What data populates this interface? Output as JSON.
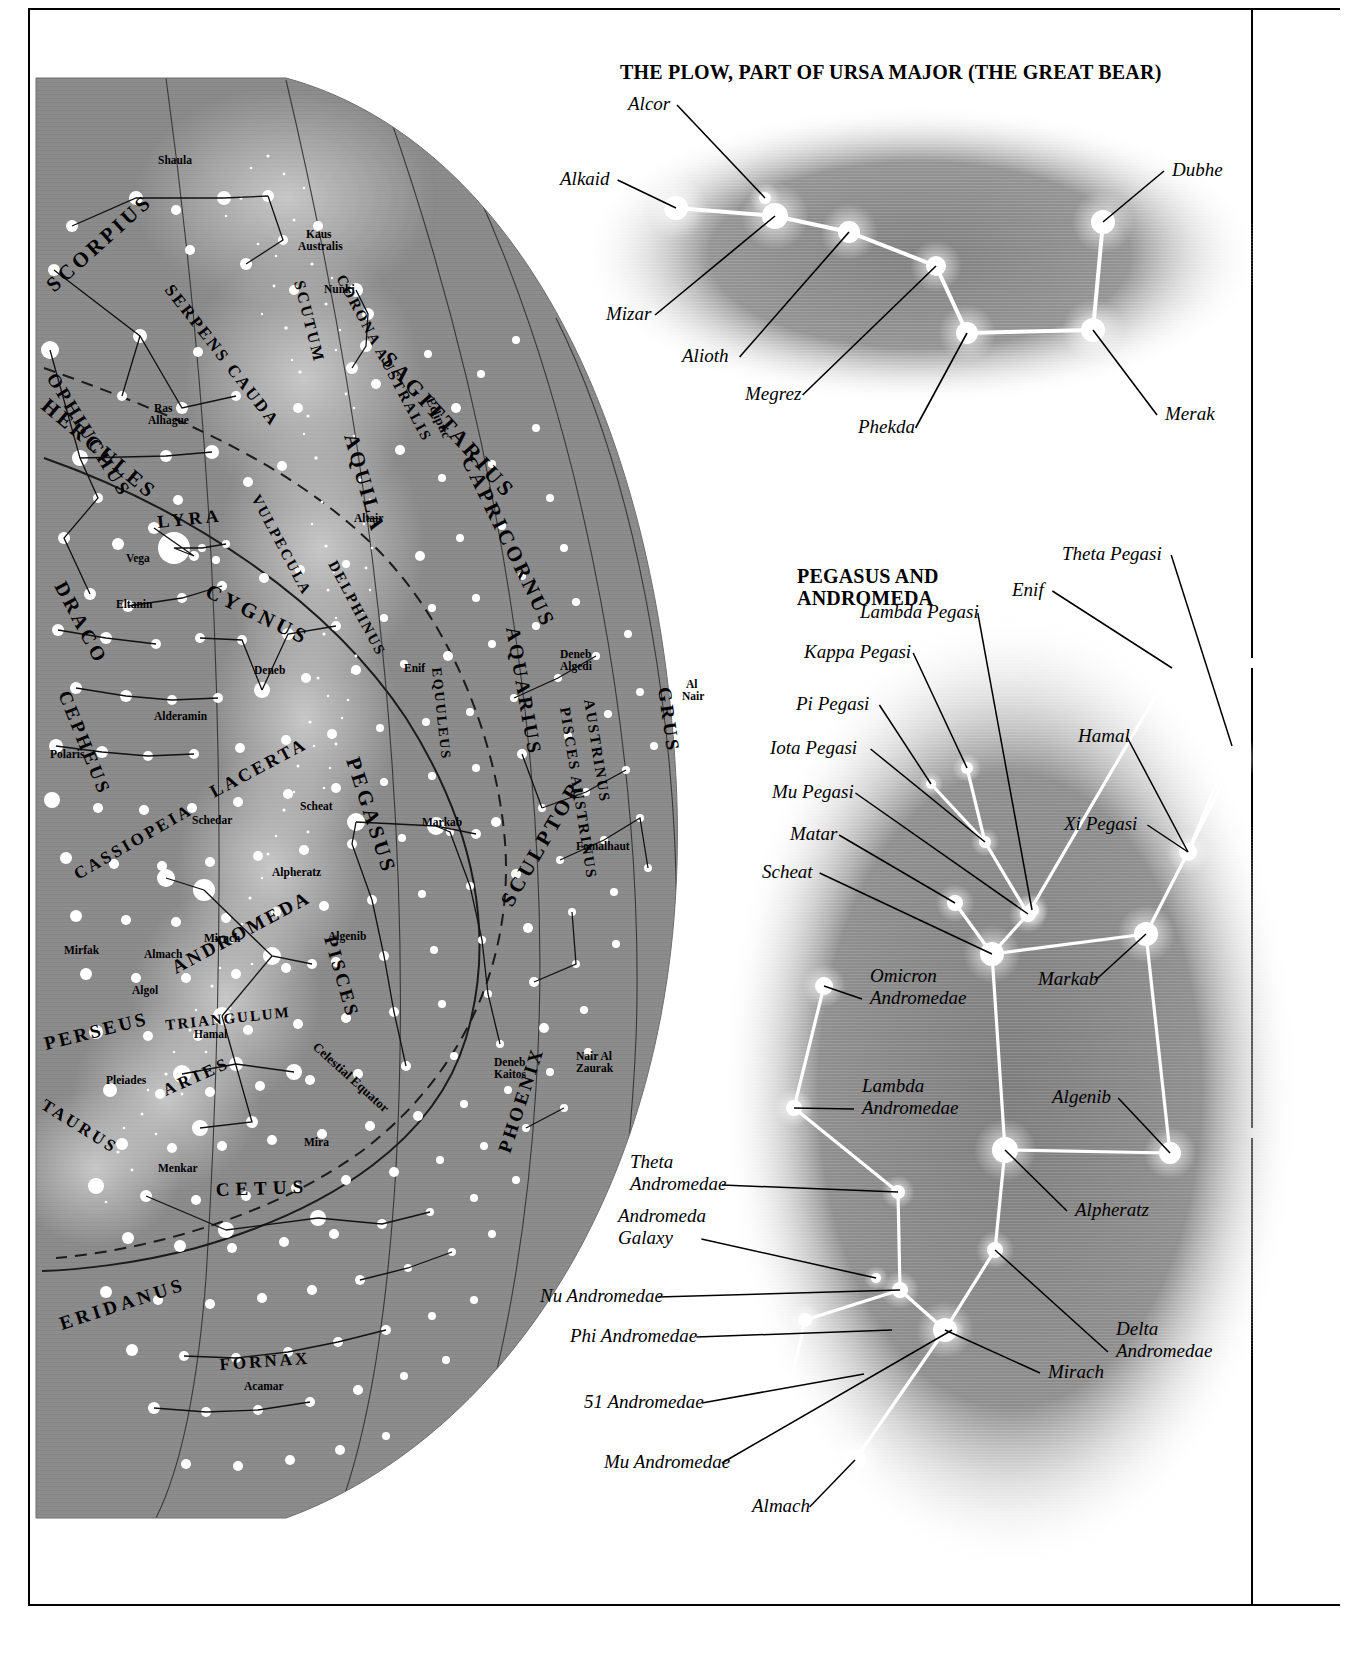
{
  "page": {
    "background_color": "#ffffff",
    "sky_fill": "#8c8c8c",
    "star_color": "#ffffff",
    "line_color": "#000000"
  },
  "plow_panel": {
    "title": "THE PLOW, PART OF URSA MAJOR (THE GREAT BEAR)",
    "labels": [
      {
        "name": "Alcor",
        "text": "Alcor",
        "lx": 68,
        "ly": 30,
        "tx": 205,
        "ty": 118
      },
      {
        "name": "Alkaid",
        "text": "Alkaid",
        "lx": 0,
        "ly": 105,
        "tx": 116,
        "ty": 128
      },
      {
        "name": "Mizar",
        "text": "Mizar",
        "lx": 46,
        "ly": 240,
        "tx": 215,
        "ty": 136
      },
      {
        "name": "Alioth",
        "text": "Alioth",
        "lx": 122,
        "ly": 282,
        "tx": 289,
        "ty": 152
      },
      {
        "name": "Megrez",
        "text": "Megrez",
        "lx": 185,
        "ly": 320,
        "tx": 376,
        "ty": 186
      },
      {
        "name": "Phekda",
        "text": "Phekda",
        "lx": 298,
        "ly": 353,
        "tx": 407,
        "ty": 253
      },
      {
        "name": "Dubhe",
        "text": "Dubhe",
        "lx": 612,
        "ly": 96,
        "tx": 543,
        "ty": 142
      },
      {
        "name": "Merak",
        "text": "Merak",
        "lx": 605,
        "ly": 340,
        "tx": 533,
        "ty": 250
      }
    ],
    "stars": [
      {
        "name": "alkaid",
        "x": 116,
        "y": 128,
        "r": 12
      },
      {
        "name": "alcor",
        "x": 205,
        "y": 118,
        "r": 6
      },
      {
        "name": "mizar",
        "x": 215,
        "y": 136,
        "r": 13
      },
      {
        "name": "alioth",
        "x": 289,
        "y": 152,
        "r": 11
      },
      {
        "name": "megrez",
        "x": 376,
        "y": 186,
        "r": 10
      },
      {
        "name": "phekda",
        "x": 407,
        "y": 253,
        "r": 11
      },
      {
        "name": "merak",
        "x": 533,
        "y": 250,
        "r": 12
      },
      {
        "name": "dubhe",
        "x": 543,
        "y": 142,
        "r": 12
      }
    ],
    "asterism": [
      [
        "alkaid",
        "mizar"
      ],
      [
        "mizar",
        "alioth"
      ],
      [
        "alioth",
        "megrez"
      ],
      [
        "megrez",
        "phekda"
      ],
      [
        "phekda",
        "merak"
      ],
      [
        "merak",
        "dubhe"
      ]
    ]
  },
  "pegasus_panel": {
    "title_line1": "PEGASUS AND",
    "title_line2": "ANDROMEDA",
    "labels": [
      {
        "name": "theta-pegasi",
        "text": "Theta Pegasi",
        "lx": 522,
        "ly": 30,
        "tx": 692,
        "ty": 216
      },
      {
        "name": "enif",
        "text": "Enif",
        "lx": 472,
        "ly": 66,
        "tx": 632,
        "ty": 138
      },
      {
        "name": "lambda-pegasi",
        "text": "Lambda Pegasi",
        "lx": 320,
        "ly": 88,
        "tx": 492,
        "ty": 380
      },
      {
        "name": "kappa-pegasi",
        "text": "Kappa Pegasi",
        "lx": 264,
        "ly": 128,
        "tx": 427,
        "ty": 238
      },
      {
        "name": "pi-pegasi",
        "text": "Pi Pegasi",
        "lx": 256,
        "ly": 180,
        "tx": 391,
        "ty": 254
      },
      {
        "name": "iota-pegasi",
        "text": "Iota Pegasi",
        "lx": 230,
        "ly": 224,
        "tx": 445,
        "ty": 312
      },
      {
        "name": "mu-pegasi",
        "text": "Mu Pegasi",
        "lx": 232,
        "ly": 268,
        "tx": 488,
        "ty": 384
      },
      {
        "name": "matar",
        "text": "Matar",
        "lx": 250,
        "ly": 310,
        "tx": 415,
        "ty": 373
      },
      {
        "name": "scheat",
        "text": "Scheat",
        "lx": 222,
        "ly": 348,
        "tx": 452,
        "ty": 424
      },
      {
        "name": "hamal",
        "text": "Hamal",
        "lx": 538,
        "ly": 212,
        "tx": 648,
        "ty": 322
      },
      {
        "name": "xi-pegasi",
        "text": "Xi Pegasi",
        "lx": 524,
        "ly": 300,
        "tx": 648,
        "ty": 322
      },
      {
        "name": "markab",
        "text": "Markab",
        "lx": 498,
        "ly": 455,
        "tx": 606,
        "ty": 404
      },
      {
        "name": "omicron-andromedae",
        "text": "Omicron\nAndromedae",
        "lx": 330,
        "ly": 452,
        "tx": 284,
        "ty": 456
      },
      {
        "name": "lambda-andromedae",
        "text": "Lambda\nAndromedae",
        "lx": 322,
        "ly": 562,
        "tx": 254,
        "ty": 578
      },
      {
        "name": "algenib",
        "text": "Algenib",
        "lx": 512,
        "ly": 573,
        "tx": 630,
        "ty": 623
      },
      {
        "name": "alpheratz",
        "text": "Alpheratz",
        "lx": 535,
        "ly": 686,
        "tx": 465,
        "ty": 620
      },
      {
        "name": "theta-andromedae",
        "text": "Theta\nAndromedae",
        "lx": 90,
        "ly": 638,
        "tx": 358,
        "ty": 662
      },
      {
        "name": "andromeda-galaxy",
        "text": "Andromeda\nGalaxy",
        "lx": 78,
        "ly": 692,
        "tx": 336,
        "ty": 748
      },
      {
        "name": "nu-andromedae",
        "text": "Nu Andromedae",
        "lx": 0,
        "ly": 772,
        "tx": 360,
        "ty": 760
      },
      {
        "name": "phi-andromedae",
        "text": "Phi Andromedae",
        "lx": 30,
        "ly": 812,
        "tx": 352,
        "ty": 800
      },
      {
        "name": "51-andromedae",
        "text": "51 Andromedae",
        "lx": 44,
        "ly": 878,
        "tx": 324,
        "ty": 844
      },
      {
        "name": "mu-andromedae",
        "text": "Mu Andromedae",
        "lx": 64,
        "ly": 938,
        "tx": 412,
        "ty": 800
      },
      {
        "name": "almach",
        "text": "Almach",
        "lx": 212,
        "ly": 982,
        "tx": 315,
        "ty": 930
      },
      {
        "name": "mirach",
        "text": "Mirach",
        "lx": 508,
        "ly": 848,
        "tx": 405,
        "ty": 800
      },
      {
        "name": "delta-andromedae",
        "text": "Delta\nAndromedae",
        "lx": 576,
        "ly": 805,
        "tx": 455,
        "ty": 720
      }
    ],
    "stars": [
      {
        "name": "theta-pegasi",
        "x": 692,
        "y": 216,
        "r": 7
      },
      {
        "name": "enif",
        "x": 632,
        "y": 138,
        "r": 12
      },
      {
        "name": "lambda-pegasi",
        "x": 492,
        "y": 380,
        "r": 7
      },
      {
        "name": "kappa-pegasi",
        "x": 427,
        "y": 238,
        "r": 6
      },
      {
        "name": "pi-pegasi",
        "x": 391,
        "y": 254,
        "r": 5
      },
      {
        "name": "iota-pegasi",
        "x": 445,
        "y": 312,
        "r": 6
      },
      {
        "name": "mu-pegasi",
        "x": 488,
        "y": 384,
        "r": 8
      },
      {
        "name": "matar",
        "x": 415,
        "y": 373,
        "r": 8
      },
      {
        "name": "scheat",
        "x": 452,
        "y": 424,
        "r": 12
      },
      {
        "name": "markab",
        "x": 606,
        "y": 404,
        "r": 12
      },
      {
        "name": "xi-pegasi",
        "x": 648,
        "y": 322,
        "r": 9
      },
      {
        "name": "hamal",
        "x": 695,
        "y": 228,
        "r": 10
      },
      {
        "name": "algenib",
        "x": 630,
        "y": 623,
        "r": 11
      },
      {
        "name": "alpheratz",
        "x": 465,
        "y": 620,
        "r": 13
      },
      {
        "name": "omicron-and",
        "x": 284,
        "y": 456,
        "r": 9
      },
      {
        "name": "lambda-and",
        "x": 254,
        "y": 578,
        "r": 8
      },
      {
        "name": "theta-and",
        "x": 358,
        "y": 662,
        "r": 7
      },
      {
        "name": "nu-and",
        "x": 360,
        "y": 760,
        "r": 8
      },
      {
        "name": "galaxy",
        "x": 336,
        "y": 748,
        "r": 5
      },
      {
        "name": "phi-and",
        "x": 265,
        "y": 790,
        "r": 7
      },
      {
        "name": "51-and",
        "x": 250,
        "y": 856,
        "r": 6
      },
      {
        "name": "mirach",
        "x": 405,
        "y": 800,
        "r": 12
      },
      {
        "name": "delta-and",
        "x": 455,
        "y": 720,
        "r": 8
      },
      {
        "name": "mu-and",
        "x": 412,
        "y": 800,
        "r": 5
      },
      {
        "name": "almach",
        "x": 315,
        "y": 930,
        "r": 11
      }
    ],
    "asterism": [
      [
        "enif",
        "mu-pegasi"
      ],
      [
        "theta-pegasi",
        "xi-pegasi"
      ],
      [
        "lambda-pegasi",
        "mu-pegasi"
      ],
      [
        "kappa-pegasi",
        "iota-pegasi"
      ],
      [
        "pi-pegasi",
        "iota-pegasi"
      ],
      [
        "iota-pegasi",
        "mu-pegasi"
      ],
      [
        "mu-pegasi",
        "scheat"
      ],
      [
        "matar",
        "scheat"
      ],
      [
        "scheat",
        "markab"
      ],
      [
        "scheat",
        "alpheratz"
      ],
      [
        "markab",
        "xi-pegasi"
      ],
      [
        "xi-pegasi",
        "hamal"
      ],
      [
        "markab",
        "algenib"
      ],
      [
        "algenib",
        "alpheratz"
      ],
      [
        "alpheratz",
        "delta-and"
      ],
      [
        "delta-and",
        "mirach"
      ],
      [
        "omicron-and",
        "lambda-and"
      ],
      [
        "lambda-and",
        "theta-and"
      ],
      [
        "theta-and",
        "nu-and"
      ],
      [
        "nu-and",
        "mirach"
      ],
      [
        "nu-and",
        "phi-and"
      ],
      [
        "phi-and",
        "51-and"
      ],
      [
        "mirach",
        "almach"
      ]
    ]
  },
  "skymap": {
    "constellations": [
      {
        "name": "SCORPIUS",
        "text": "SCORPIUS"
      },
      {
        "name": "OPHIUCHUS",
        "text": "OPHIUCHUS"
      },
      {
        "name": "SERPENS CAUDA",
        "text": "SERPENS CAUDA"
      },
      {
        "name": "CORONA AUSTRALIS",
        "text": "CORONA AUSTRALIS"
      },
      {
        "name": "SCUTUM",
        "text": "SCUTUM"
      },
      {
        "name": "SAGITTARIUS",
        "text": "SAGITTARIUS"
      },
      {
        "name": "AQUILA",
        "text": "AQUILA"
      },
      {
        "name": "CAPRICORNUS",
        "text": "CAPRICORNUS"
      },
      {
        "name": "HERCULES",
        "text": "HERCULES"
      },
      {
        "name": "LYRA",
        "text": "LYRA"
      },
      {
        "name": "VULPECULA",
        "text": "VULPECULA"
      },
      {
        "name": "DELPHINUS",
        "text": "DELPHINUS"
      },
      {
        "name": "EQUULEUS",
        "text": "EQUULEUS"
      },
      {
        "name": "DRACO",
        "text": "DRACO"
      },
      {
        "name": "CYGNUS",
        "text": "CYGNUS"
      },
      {
        "name": "AQUARIUS",
        "text": "AQUARIUS"
      },
      {
        "name": "PISCES AUSTRINUS",
        "text": "PISCES AUSTRINUS"
      },
      {
        "name": "GRUS",
        "text": "GRUS"
      },
      {
        "name": "CEPHEUS",
        "text": "CEPHEUS"
      },
      {
        "name": "LACERTA",
        "text": "LACERTA"
      },
      {
        "name": "PEGASUS",
        "text": "PEGASUS"
      },
      {
        "name": "CASSIOPEIA",
        "text": "CASSIOPEIA"
      },
      {
        "name": "ANDROMEDA",
        "text": "ANDROMEDA"
      },
      {
        "name": "PISCES",
        "text": "PISCES"
      },
      {
        "name": "SCULPTOR",
        "text": "SCULPTOR"
      },
      {
        "name": "PERSEUS",
        "text": "PERSEUS"
      },
      {
        "name": "TRIANGULUM",
        "text": "TRIANGULUM"
      },
      {
        "name": "ARIES",
        "text": "ARIES"
      },
      {
        "name": "TAURUS",
        "text": "TAURUS"
      },
      {
        "name": "CETUS",
        "text": "CETUS"
      },
      {
        "name": "PHOENIX",
        "text": "PHOENIX"
      },
      {
        "name": "ERIDANUS",
        "text": "ERIDANUS"
      },
      {
        "name": "FORNAX",
        "text": "FORNAX"
      }
    ],
    "star_labels": [
      "Shaula",
      "Kaus Australis",
      "Nunki",
      "Ras Alhague",
      "Vega",
      "Eltanin",
      "Deneb",
      "Altair",
      "Enif",
      "Deneb Algedi",
      "Al Nair",
      "Alderamin",
      "Polaris",
      "Scheat",
      "Markab",
      "Schedar",
      "Fomalhaut",
      "Alpheratz",
      "Mirach",
      "Algenib",
      "Mirfak",
      "Almach",
      "Algol",
      "Hamal",
      "Pleiades",
      "Mira",
      "Menkar",
      "Deneb Kaitos",
      "Nair Al Zaurak",
      "Acamar"
    ],
    "grid_lines": [
      "Ecliptic",
      "Celestial Equator"
    ]
  }
}
